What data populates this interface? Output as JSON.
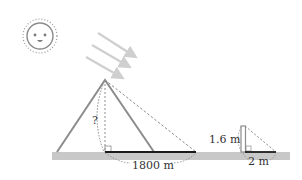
{
  "diagram": {
    "labels": {
      "pyramid_height": "?",
      "pyramid_shadow": "1800 m",
      "pole_height": "1.6 m",
      "pole_shadow": "2 m"
    },
    "elements": {
      "sun": "smiling sun with dotted rays",
      "sun_rays": 3,
      "pyramid": "triangle with dashed height and shadow line",
      "pole": "vertical stick with shadow"
    },
    "colors": {
      "outline": "#8c8c8c",
      "ground": "#c8c8c8",
      "shadow_line": "#1a1a1a",
      "rays": "#cfcfcf",
      "text": "#333333"
    }
  }
}
